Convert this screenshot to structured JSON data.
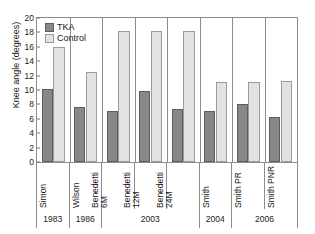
{
  "chart_data": {
    "type": "bar",
    "title": "",
    "xlabel": "",
    "ylabel": "Knee angle (degrees)",
    "ylim": [
      0,
      20
    ],
    "yticks": [
      0,
      2,
      4,
      6,
      8,
      10,
      12,
      14,
      16,
      18,
      20
    ],
    "grid": false,
    "legend_position": "top-left",
    "categories": [
      "Simon",
      "Wilson",
      "Benedetti 6M",
      "Benedetti 12M",
      "Benedetti 24M",
      "Smith",
      "Smith PR",
      "Smith PNR"
    ],
    "category_lines": [
      [
        "Simon"
      ],
      [
        "Wilson"
      ],
      [
        "Benedetti",
        "6M"
      ],
      [
        "Benedetti",
        "12M"
      ],
      [
        "Benedetti",
        "24M"
      ],
      [
        "Smith"
      ],
      [
        "Smith PR"
      ],
      [
        "Smith PNR"
      ]
    ],
    "series": [
      {
        "name": "TKA",
        "color": "#878787",
        "values": [
          10.1,
          7.7,
          7.1,
          9.9,
          7.4,
          7.1,
          8.1,
          6.2
        ]
      },
      {
        "name": "Control",
        "color": "#e2e2e2",
        "values": [
          16.0,
          12.5,
          18.2,
          18.2,
          18.2,
          11.1,
          11.1,
          11.2
        ]
      }
    ],
    "year_groups": [
      {
        "label": "1983",
        "span": 1
      },
      {
        "label": "1986",
        "span": 1
      },
      {
        "label": "2003",
        "span": 3
      },
      {
        "label": "2004",
        "span": 1
      },
      {
        "label": "2006",
        "span": 2
      }
    ]
  },
  "legend": {
    "items": [
      {
        "label": "TKA"
      },
      {
        "label": "Control"
      }
    ]
  },
  "colors": {
    "tka": "#878787",
    "control": "#e2e2e2",
    "axis": "#8d8d8d",
    "text": "#1a1a1a"
  }
}
